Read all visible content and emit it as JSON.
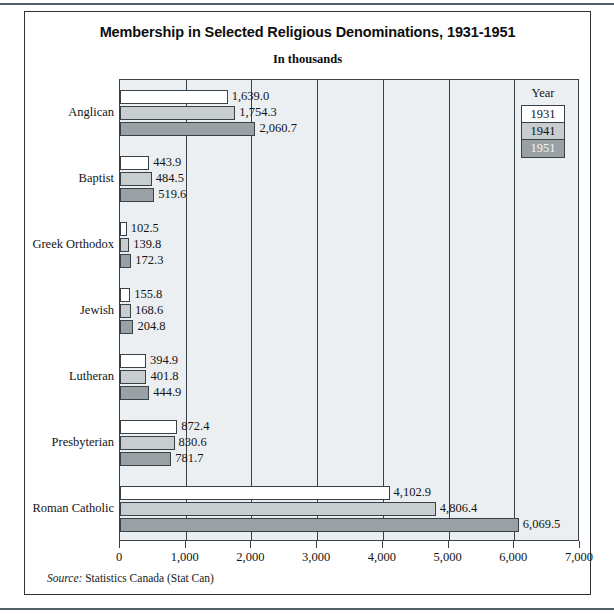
{
  "figure": {
    "title": "Membership in Selected Religious Denominations, 1931-1951",
    "subtitle": "In thousands",
    "source_label": "Source:",
    "source_text": " Statistics Canada (Stat Can)"
  },
  "legend": {
    "title": "Year",
    "items": [
      {
        "label": "1931",
        "color": "#ffffff"
      },
      {
        "label": "1941",
        "color": "#c8cdd0"
      },
      {
        "label": "1951",
        "color": "#9aa1a5"
      }
    ]
  },
  "axis": {
    "ticks": [
      "0",
      "1,000",
      "2,000",
      "3,000",
      "4,000",
      "5,000",
      "6,000",
      "7,000"
    ],
    "tick_values": [
      0,
      1000,
      2000,
      3000,
      4000,
      5000,
      6000,
      7000
    ]
  },
  "chart_data": {
    "type": "bar",
    "orientation": "horizontal",
    "title": "Membership in Selected Religious Denominations, 1931-1951",
    "subtitle": "In thousands",
    "xlabel": "",
    "ylabel": "",
    "xlim": [
      0,
      7000
    ],
    "grid": true,
    "legend_position": "inside-right",
    "legend_title": "Year",
    "categories": [
      "Anglican",
      "Baptist",
      "Greek Orthodox",
      "Jewish",
      "Lutheran",
      "Presbyterian",
      "Roman Catholic"
    ],
    "series": [
      {
        "name": "1931",
        "color": "#ffffff",
        "values": [
          1639.0,
          443.9,
          102.5,
          155.8,
          394.9,
          872.4,
          4102.9
        ],
        "labels": [
          "1,639.0",
          "443.9",
          "102.5",
          "155.8",
          "394.9",
          "872.4",
          "4,102.9"
        ]
      },
      {
        "name": "1941",
        "color": "#c8cdd0",
        "values": [
          1754.3,
          484.5,
          139.8,
          168.6,
          401.8,
          830.6,
          4806.4
        ],
        "labels": [
          "1,754.3",
          "484.5",
          "139.8",
          "168.6",
          "401.8",
          "830.6",
          "4,806.4"
        ]
      },
      {
        "name": "1951",
        "color": "#9aa1a5",
        "values": [
          2060.7,
          519.6,
          172.3,
          204.8,
          444.9,
          781.7,
          6069.5
        ],
        "labels": [
          "2,060.7",
          "519.6",
          "172.3",
          "204.8",
          "444.9",
          "781.7",
          "6,069.5"
        ]
      }
    ],
    "source": "Source: Statistics Canada (Stat Can)"
  }
}
